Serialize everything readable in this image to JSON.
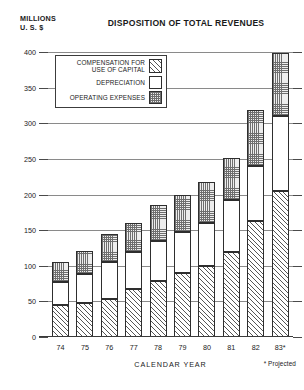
{
  "header": {
    "unit_label": "MILLIONS\nU. S. $",
    "title": "DISPOSITION OF TOTAL REVENUES"
  },
  "legend": {
    "entries": [
      {
        "label": "COMPENSATION FOR\nUSE OF CAPITAL",
        "swatch": "diagonal-hatch-swatch"
      },
      {
        "label": "DEPRECIATION",
        "swatch": "white-swatch"
      },
      {
        "label": "OPERATING EXPENSES",
        "swatch": "stipple-swatch"
      }
    ]
  },
  "axes": {
    "y_ticks": [
      "400",
      "350",
      "300",
      "250",
      "200",
      "150",
      "100",
      "50",
      "0"
    ],
    "x_title": "CALENDAR YEAR",
    "x_ticks": [
      "74",
      "75",
      "76",
      "77",
      "78",
      "79",
      "80",
      "81",
      "82",
      "83*"
    ]
  },
  "footnote": "* Projected",
  "colors": {
    "ink": "#1a1a1a",
    "grid": "#8a8a8a",
    "bar_outline": "#2e2e2e",
    "stipple_fill": "#ededed",
    "white_fill": "#ffffff"
  },
  "chart_data": {
    "type": "bar",
    "stacked": true,
    "title": "DISPOSITION OF TOTAL REVENUES",
    "subtitle": "MILLIONS U. S. $",
    "xlabel": "CALENDAR YEAR",
    "ylabel": "MILLIONS U. S. $",
    "ylim": [
      0,
      400
    ],
    "ytick_step": 50,
    "grid": true,
    "legend_position": "upper-left-inside",
    "annotations": [
      "* Projected"
    ],
    "categories": [
      "74",
      "75",
      "76",
      "77",
      "78",
      "79",
      "80",
      "81",
      "82",
      "83*"
    ],
    "series": [
      {
        "name": "COMPENSATION FOR USE OF CAPITAL",
        "fill": "diagonal-hatch",
        "stack_order": 1,
        "values": [
          45,
          48,
          53,
          68,
          78,
          90,
          100,
          120,
          163,
          205
        ]
      },
      {
        "name": "DEPRECIATION",
        "fill": "white",
        "stack_order": 2,
        "values": [
          32,
          40,
          52,
          52,
          57,
          58,
          60,
          73,
          77,
          105
        ]
      },
      {
        "name": "OPERATING EXPENSES",
        "fill": "stipple",
        "stack_order": 3,
        "values": [
          28,
          33,
          40,
          40,
          50,
          52,
          58,
          58,
          78,
          88
        ]
      }
    ],
    "totals": [
      105,
      121,
      145,
      160,
      185,
      200,
      218,
      251,
      318,
      398
    ]
  }
}
